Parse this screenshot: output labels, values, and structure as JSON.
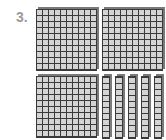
{
  "problem": {
    "number_label": "3.",
    "blocks": {
      "hundreds_flats": 3,
      "tens_rods": 5,
      "ones_units": 0
    }
  },
  "colors": {
    "block_fill": "#d4d4d4",
    "grid_line": "#3a3a3a",
    "label": "#9a9a9a"
  }
}
